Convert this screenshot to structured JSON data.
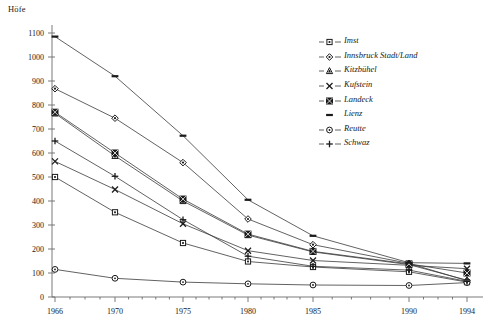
{
  "chart_data": {
    "type": "line",
    "title": "Höfe",
    "xlabel": "",
    "ylabel": "Höfe",
    "x": [
      1966,
      1970,
      1975,
      1980,
      1985,
      1990,
      1994
    ],
    "xtick_labels": [
      "1966",
      "1970",
      "1975",
      "1980",
      "1985",
      "1990",
      "1994"
    ],
    "ytick_labels": [
      "0",
      "100",
      "200",
      "300",
      "400",
      "500",
      "600",
      "700",
      "800",
      "900",
      "1000",
      "1100"
    ],
    "ylim": [
      0,
      1100
    ],
    "ytick_step": 100,
    "grid": false,
    "legend_position": "right",
    "series": [
      {
        "name": "Imst",
        "marker": "square-open",
        "values": [
          500,
          353,
          225,
          148,
          125,
          105,
          62
        ]
      },
      {
        "name": "Innsbruck Stadt/Land",
        "marker": "diamond",
        "values": [
          868,
          745,
          560,
          325,
          218,
          140,
          68
        ]
      },
      {
        "name": "Kitzbühel",
        "marker": "triangle",
        "values": [
          765,
          588,
          400,
          258,
          188,
          135,
          70
        ]
      },
      {
        "name": "Kufstein",
        "marker": "cross-x",
        "values": [
          565,
          448,
          305,
          193,
          152,
          132,
          118
        ]
      },
      {
        "name": "Landeck",
        "marker": "square-x",
        "values": [
          770,
          600,
          408,
          262,
          190,
          138,
          100
        ]
      },
      {
        "name": "Lienz",
        "marker": "dash",
        "values": [
          1085,
          920,
          672,
          405,
          255,
          143,
          140
        ]
      },
      {
        "name": "Reutte",
        "marker": "circle-open",
        "values": [
          115,
          78,
          62,
          55,
          50,
          48,
          60
        ]
      },
      {
        "name": "Schwaz",
        "marker": "plus",
        "values": [
          650,
          503,
          322,
          170,
          128,
          112,
          65
        ]
      }
    ]
  }
}
